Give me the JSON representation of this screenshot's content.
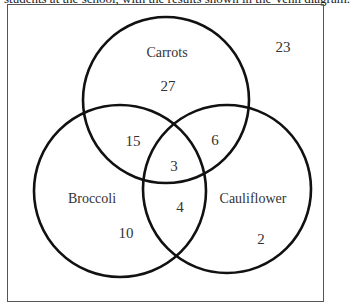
{
  "caption": {
    "text": "students at the school, with the results shown in the Venn diagram."
  },
  "diagram": {
    "type": "venn",
    "sets": [
      {
        "name": "Carrots",
        "cx": 166,
        "cy": 100,
        "r": 83
      },
      {
        "name": "Broccoli",
        "cx": 120,
        "cy": 191,
        "r": 86
      },
      {
        "name": "Cauliflower",
        "cx": 227,
        "cy": 189,
        "r": 84
      }
    ],
    "labels": {
      "carrots": "Carrots",
      "broccoli": "Broccoli",
      "cauliflower": "Cauliflower"
    },
    "regions": {
      "carrots_only": "27",
      "broccoli_only": "10",
      "cauliflower_only": "2",
      "carrots_broccoli": "15",
      "carrots_cauliflower": "6",
      "broccoli_cauliflower": "4",
      "all_three": "3",
      "outside": "23"
    },
    "stroke_color": "#111111",
    "frame_color": "#555555"
  }
}
